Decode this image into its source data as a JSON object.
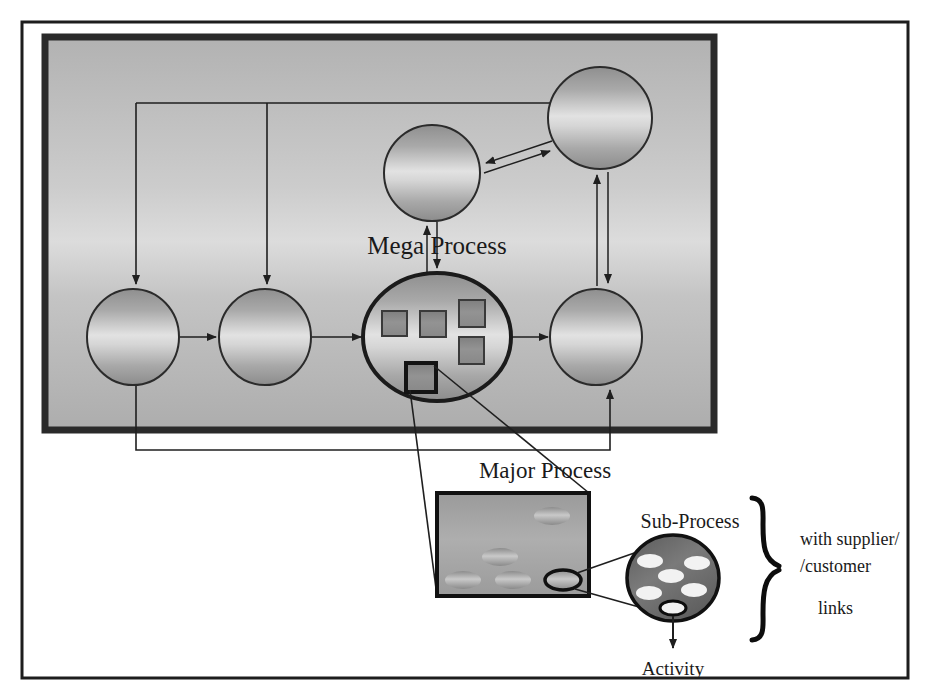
{
  "figure": {
    "title_visible": false,
    "background": "#ffffff",
    "outer_frame_color": "#1d1d1d",
    "inner_panel_fill_top": "#b4b4b4",
    "inner_panel_fill_mid": "#d8d8d8",
    "inner_panel_fill_bottom": "#b0b0b0",
    "inner_panel_border_color": "#2a2a2a",
    "line_color": "#1f1f1f",
    "node_stroke": "#2b2b2b",
    "square_fill": "#8d8d8d",
    "square_stroke": "#3a3a3a"
  },
  "labels": {
    "mega_process": "Mega Process",
    "major_process": "Major Process",
    "sub_process": "Sub-Process",
    "activity": "Activity",
    "bracket_line1": "with supplier/",
    "bracket_line2": "/customer",
    "bracket_line3": "links"
  },
  "mega_level": {
    "description": "Mega Process level: gray panel containing six process nodes connected by arrows",
    "nodes": [
      {
        "id": "n1",
        "name": "mega-node-left-1",
        "cx": 133,
        "cy": 337,
        "rx": 45,
        "ry": 47,
        "highlighted": false
      },
      {
        "id": "n2",
        "name": "mega-node-left-2",
        "cx": 265,
        "cy": 337,
        "rx": 45,
        "ry": 47,
        "highlighted": false
      },
      {
        "id": "n3",
        "name": "mega-node-center",
        "cx": 437,
        "cy": 337,
        "rx": 72,
        "ry": 62,
        "highlighted": true
      },
      {
        "id": "n4",
        "name": "mega-node-right",
        "cx": 596,
        "cy": 337,
        "rx": 45,
        "ry": 47,
        "highlighted": false
      },
      {
        "id": "n5",
        "name": "mega-node-upper-mid",
        "cx": 432,
        "cy": 173,
        "rx": 48,
        "ry": 47,
        "highlighted": false
      },
      {
        "id": "n6",
        "name": "mega-node-upper-right",
        "cx": 600,
        "cy": 118,
        "rx": 52,
        "ry": 50,
        "highlighted": false
      }
    ],
    "center_squares": [
      {
        "x": 382,
        "y": 311,
        "w": 25,
        "h": 25,
        "highlighted": false
      },
      {
        "x": 420,
        "y": 311,
        "w": 26,
        "h": 26,
        "highlighted": false
      },
      {
        "x": 459,
        "y": 300,
        "w": 26,
        "h": 27,
        "highlighted": false
      },
      {
        "x": 459,
        "y": 337,
        "w": 25,
        "h": 27,
        "highlighted": false
      },
      {
        "x": 406,
        "y": 363,
        "w": 30,
        "h": 29,
        "highlighted": true
      }
    ],
    "edge_count": 10
  },
  "major_level": {
    "description": "Major Process box containing sub-process ellipses",
    "box": {
      "x": 437,
      "y": 493,
      "w": 152,
      "h": 103
    },
    "ellipses": [
      {
        "cx": 552,
        "cy": 516,
        "rx": 18,
        "ry": 9,
        "highlighted": false
      },
      {
        "cx": 500,
        "cy": 557,
        "rx": 18,
        "ry": 9,
        "highlighted": false
      },
      {
        "cx": 463,
        "cy": 580,
        "rx": 18,
        "ry": 9,
        "highlighted": false
      },
      {
        "cx": 513,
        "cy": 580,
        "rx": 18,
        "ry": 9,
        "highlighted": false
      },
      {
        "cx": 563,
        "cy": 580,
        "rx": 18,
        "ry": 10,
        "highlighted": true
      }
    ]
  },
  "sub_level": {
    "description": "Sub-Process circle containing activity ellipses",
    "circle": {
      "cx": 673,
      "cy": 578,
      "rx": 45,
      "ry": 42
    },
    "ellipses": [
      {
        "cx": 650,
        "cy": 561,
        "rx": 13,
        "ry": 7,
        "highlighted": false
      },
      {
        "cx": 697,
        "cy": 563,
        "rx": 13,
        "ry": 7,
        "highlighted": false
      },
      {
        "cx": 671,
        "cy": 576,
        "rx": 13,
        "ry": 7,
        "highlighted": false
      },
      {
        "cx": 693,
        "cy": 589,
        "rx": 13,
        "ry": 7,
        "highlighted": false
      },
      {
        "cx": 649,
        "cy": 593,
        "rx": 13,
        "ry": 7,
        "highlighted": false
      },
      {
        "cx": 673,
        "cy": 608,
        "rx": 13,
        "ry": 7,
        "highlighted": true
      }
    ]
  },
  "bracket": {
    "x": 760,
    "y_top": 498,
    "y_bottom": 640,
    "tip_x": 782,
    "tip_y": 569
  }
}
